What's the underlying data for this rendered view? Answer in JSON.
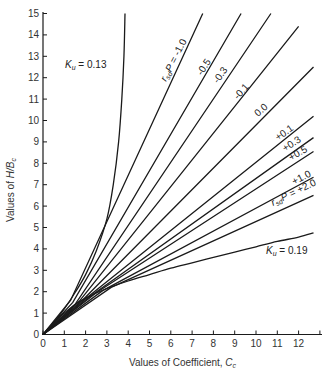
{
  "chart_data": {
    "type": "line",
    "title": "",
    "xlabel": "Values of Coefficient, C̄c",
    "ylabel": "Values of H/Bc",
    "xlim": [
      0,
      13
    ],
    "ylim": [
      0,
      15
    ],
    "grid": false,
    "legend": "inline labels on curves",
    "x_ticks": [
      "0",
      "1",
      "2",
      "3",
      "4",
      "5",
      "6",
      "7",
      "8",
      "9",
      "10",
      "11",
      "12"
    ],
    "y_ticks": [
      "0",
      "1",
      "2",
      "3",
      "4",
      "5",
      "6",
      "7",
      "8",
      "9",
      "10",
      "11",
      "12",
      "13",
      "14",
      "15"
    ],
    "boundary_curves": [
      {
        "name": "Ku = 0.13",
        "label_pos": [
          1.0,
          12.9
        ],
        "points": [
          [
            0,
            0
          ],
          [
            0.5,
            0.55
          ],
          [
            1,
            1.2
          ],
          [
            1.5,
            1.95
          ],
          [
            2,
            2.8
          ],
          [
            2.5,
            3.9
          ],
          [
            3,
            5.4
          ],
          [
            3.3,
            7
          ],
          [
            3.55,
            9
          ],
          [
            3.7,
            11
          ],
          [
            3.8,
            13
          ],
          [
            3.85,
            15
          ]
        ]
      },
      {
        "name": "Ku = 0.19",
        "label_pos": [
          9.9,
          4.0
        ],
        "points": [
          [
            0,
            0
          ],
          [
            0.5,
            0.55
          ],
          [
            1,
            1.0
          ],
          [
            1.5,
            1.4
          ],
          [
            2,
            1.7
          ],
          [
            3,
            2.15
          ],
          [
            4,
            2.5
          ],
          [
            5,
            2.8
          ],
          [
            6,
            3.1
          ],
          [
            7,
            3.35
          ],
          [
            8,
            3.6
          ],
          [
            9,
            3.85
          ],
          [
            10,
            4.1
          ],
          [
            11,
            4.35
          ],
          [
            12,
            4.55
          ],
          [
            12.7,
            4.75
          ]
        ]
      }
    ],
    "series": [
      {
        "name": "rsd·P = -1.0",
        "label": "rsdP = -1.0",
        "start": [
          1.3,
          1.6
        ],
        "end": [
          7.5,
          15.0
        ]
      },
      {
        "name": "rsd·P = -0.5",
        "label": "-0.5",
        "start": [
          1.4,
          1.5
        ],
        "end": [
          9.3,
          15.0
        ]
      },
      {
        "name": "rsd·P = -0.3",
        "label": "-0.3",
        "start": [
          1.5,
          1.4
        ],
        "end": [
          10.7,
          15.0
        ]
      },
      {
        "name": "rsd·P = -0.1",
        "label": "-0.1",
        "start": [
          1.7,
          1.55
        ],
        "end": [
          12.0,
          14.4
        ]
      },
      {
        "name": "rsd·P = 0.0",
        "label": "0.0",
        "start": [
          1.9,
          1.65
        ],
        "end": [
          12.7,
          12.5
        ]
      },
      {
        "name": "rsd·P = +0.1",
        "label": "+0.1",
        "start": [
          2.1,
          1.75
        ],
        "end": [
          12.7,
          10.2
        ]
      },
      {
        "name": "rsd·P = +0.3",
        "label": "+0.3",
        "start": [
          2.3,
          1.85
        ],
        "end": [
          12.7,
          9.2
        ]
      },
      {
        "name": "rsd·P = +0.5",
        "label": "+0.5",
        "start": [
          2.5,
          1.95
        ],
        "end": [
          12.7,
          8.55
        ]
      },
      {
        "name": "rsd·P = +1.0",
        "label": "+1.0",
        "start": [
          2.8,
          2.05
        ],
        "end": [
          12.7,
          7.35
        ]
      },
      {
        "name": "rsd·P = +2.0",
        "label": "rsdP = +2.0",
        "start": [
          3.2,
          2.2
        ],
        "end": [
          12.7,
          6.5
        ]
      }
    ],
    "annotations": [
      {
        "text": "Ku = 0.13",
        "x": 1.0,
        "y": 12.9
      },
      {
        "text": "Ku = 0.19",
        "x": 9.9,
        "y": 4.0
      }
    ]
  },
  "labels": {
    "ku013": "K",
    "ku013_sub": "u",
    "ku013_val": " = 0.13",
    "ku019": "K",
    "ku019_sub": "u",
    "ku019_val": " = 0.19",
    "xlabel_main": "Values of Coefficient, ",
    "xlabel_sym": "C",
    "xlabel_sub": "c",
    "ylabel_main": "Values of ",
    "ylabel_sym": "H/B",
    "ylabel_sub": "c",
    "r_sym": "r",
    "r_sub": "sd",
    "p_sym": "P",
    "rp_neg1": " = -1.0",
    "rp_pos2": " = +2.0",
    "l_m05": "-0.5",
    "l_m03": "-0.3",
    "l_m01": "-0.1",
    "l_00": "0.0",
    "l_p01": "+0.1",
    "l_p03": "+0.3",
    "l_p05": "+0.5",
    "l_p10": "+1.0"
  }
}
